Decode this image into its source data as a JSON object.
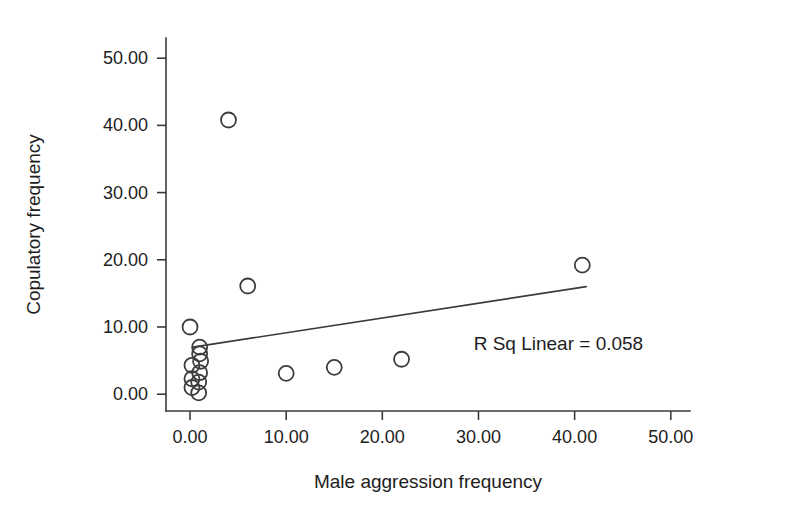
{
  "chart_data": {
    "type": "scatter",
    "title": "",
    "xlabel": "Male aggression frequency",
    "ylabel": "Copulatory frequency",
    "xlim": [
      -2.5,
      52
    ],
    "ylim": [
      -2.5,
      53
    ],
    "xticks": [
      0,
      10,
      20,
      30,
      40,
      50
    ],
    "yticks": [
      0,
      10,
      20,
      30,
      40,
      50
    ],
    "xticklabels": [
      "0.00",
      "10.00",
      "20.00",
      "30.00",
      "40.00",
      "50.00"
    ],
    "yticklabels": [
      "0.00",
      "10.00",
      "20.00",
      "30.00",
      "40.00",
      "50.00"
    ],
    "grid": false,
    "legend": null,
    "marker": "open-circle",
    "points": [
      {
        "x": 4.0,
        "y": 40.8
      },
      {
        "x": 6.0,
        "y": 16.1
      },
      {
        "x": 40.8,
        "y": 19.2
      },
      {
        "x": 0.0,
        "y": 10.0
      },
      {
        "x": 1.0,
        "y": 7.0
      },
      {
        "x": 1.0,
        "y": 6.0
      },
      {
        "x": 1.1,
        "y": 4.9
      },
      {
        "x": 0.2,
        "y": 4.3
      },
      {
        "x": 1.0,
        "y": 3.2
      },
      {
        "x": 0.2,
        "y": 2.3
      },
      {
        "x": 0.9,
        "y": 1.8
      },
      {
        "x": 0.2,
        "y": 1.0
      },
      {
        "x": 0.9,
        "y": 0.2
      },
      {
        "x": 10.0,
        "y": 3.1
      },
      {
        "x": 15.0,
        "y": 4.0
      },
      {
        "x": 22.0,
        "y": 5.2
      }
    ],
    "fit_line": {
      "label": "R Sq Linear = 0.058",
      "r_squared": 0.058,
      "x_start": 0.3,
      "y_start": 7.0,
      "x_end": 41.2,
      "y_end": 16.0
    },
    "annotation": "R Sq Linear = 0.058",
    "colors": {
      "marker_stroke": "#3d3d3d",
      "line": "#3a3a3a",
      "axis": "#3a3a3a",
      "text": "#1d1d1d",
      "background": "#ffffff"
    }
  }
}
